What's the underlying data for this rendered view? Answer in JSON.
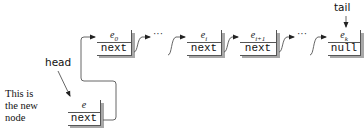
{
  "diagram": {
    "nodes": [
      {
        "id": "e0",
        "element": "e",
        "subscript": "0",
        "pointer": "next"
      },
      {
        "id": "ei",
        "element": "e",
        "subscript": "i",
        "pointer": "next"
      },
      {
        "id": "ei1",
        "element": "e",
        "subscript": "i+1",
        "pointer": "next"
      },
      {
        "id": "ek",
        "element": "e",
        "subscript": "k",
        "pointer": "null"
      }
    ],
    "new_node": {
      "element": "e",
      "subscript": "",
      "pointer": "next"
    },
    "ellipses": [
      "···",
      "···"
    ],
    "labels": {
      "head": "head",
      "tail": "tail",
      "new_node_caption_line1": "This is",
      "new_node_caption_line2": "the new",
      "new_node_caption_line3": "node"
    },
    "colors": {
      "line": "#555555",
      "shadow": "#9a9a9a",
      "text": "#111111"
    }
  }
}
